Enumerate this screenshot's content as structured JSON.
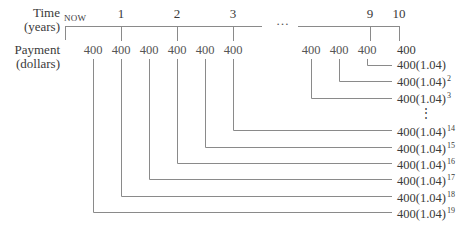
{
  "labels": {
    "time": "Time",
    "time_unit": "(years)",
    "payment": "Payment",
    "payment_unit": "(dollars)",
    "now": "NOW",
    "ellipsis": "…",
    "vdots": "⋮"
  },
  "timeline_ticks": [
    "1",
    "2",
    "3",
    "9",
    "10"
  ],
  "payments": [
    "400",
    "400",
    "400",
    "400",
    "400",
    "400",
    "400",
    "400",
    "400",
    "400"
  ],
  "future_values": [
    {
      "base": "400",
      "exp": ""
    },
    {
      "base": "400(1.04)",
      "exp": ""
    },
    {
      "base": "400(1.04)",
      "exp": "2"
    },
    {
      "base": "400(1.04)",
      "exp": "3"
    },
    {
      "base": "400(1.04)",
      "exp": "14"
    },
    {
      "base": "400(1.04)",
      "exp": "15"
    },
    {
      "base": "400(1.04)",
      "exp": "16"
    },
    {
      "base": "400(1.04)",
      "exp": "17"
    },
    {
      "base": "400(1.04)",
      "exp": "18"
    },
    {
      "base": "400(1.04)",
      "exp": "19"
    }
  ],
  "colors": {
    "line": "#8a8a8a",
    "text": "#3a3a3a"
  }
}
